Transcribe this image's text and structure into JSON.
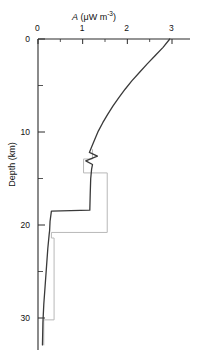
{
  "chart_data": {
    "type": "line",
    "title": "A (μW m-3)",
    "title_symbol": "A",
    "title_unit_pre": " (μW m",
    "title_unit_exp": "-3",
    "title_unit_post": ")",
    "xlabel": "A (μW m⁻³)",
    "ylabel": "Depth (km)",
    "xlim": [
      0,
      3.2
    ],
    "ylim": [
      0,
      34
    ],
    "y_inverted": true,
    "grid": false,
    "legend": null,
    "xticks": [
      0,
      1,
      2,
      3
    ],
    "xtick_labels": [
      "0",
      "1",
      "2",
      "3"
    ],
    "xminorticks": [
      0.5,
      1.5,
      2.5
    ],
    "yticks": [
      0,
      10,
      20,
      30
    ],
    "ytick_labels": [
      "0",
      "10",
      "20",
      "30"
    ],
    "yminorticks": [
      5,
      15,
      25
    ],
    "series": [
      {
        "name": "smoothed-heat-production-profile",
        "style": "solid",
        "color": "#3a3a3a",
        "width": 1.3,
        "points": [
          [
            2.95,
            0.0
          ],
          [
            2.8,
            0.9
          ],
          [
            2.62,
            1.8
          ],
          [
            2.44,
            2.7
          ],
          [
            2.27,
            3.6
          ],
          [
            2.1,
            4.5
          ],
          [
            1.95,
            5.4
          ],
          [
            1.81,
            6.3
          ],
          [
            1.68,
            7.2
          ],
          [
            1.56,
            8.1
          ],
          [
            1.45,
            9.0
          ],
          [
            1.35,
            9.9
          ],
          [
            1.27,
            10.8
          ],
          [
            1.2,
            11.6
          ],
          [
            1.15,
            12.2
          ],
          [
            1.33,
            12.6
          ],
          [
            1.07,
            13.1
          ],
          [
            1.22,
            13.5
          ],
          [
            1.2,
            14.0
          ],
          [
            1.18,
            15.0
          ],
          [
            1.17,
            16.5
          ],
          [
            1.16,
            18.4
          ],
          [
            0.3,
            18.5
          ],
          [
            0.27,
            19.6
          ],
          [
            0.26,
            20.6
          ],
          [
            0.25,
            21.0
          ],
          [
            0.22,
            22.5
          ],
          [
            0.19,
            24.5
          ],
          [
            0.16,
            26.5
          ],
          [
            0.13,
            28.5
          ],
          [
            0.11,
            30.5
          ],
          [
            0.1,
            32.9
          ]
        ]
      },
      {
        "name": "layered-step-model",
        "style": "solid",
        "color": "#b8b8b8",
        "width": 1.0,
        "points": [
          [
            1.22,
            11.9
          ],
          [
            1.22,
            12.9
          ],
          [
            1.02,
            12.9
          ],
          [
            1.02,
            14.4
          ],
          [
            1.55,
            14.4
          ],
          [
            1.55,
            20.8
          ],
          [
            0.3,
            20.8
          ],
          [
            0.3,
            21.4
          ],
          [
            0.36,
            21.4
          ],
          [
            0.36,
            30.2
          ],
          [
            0.13,
            30.2
          ],
          [
            0.13,
            32.9
          ]
        ]
      }
    ]
  },
  "axes": {
    "axis_color": "#2b2b2b",
    "top_axis": true,
    "left_axis": true
  }
}
